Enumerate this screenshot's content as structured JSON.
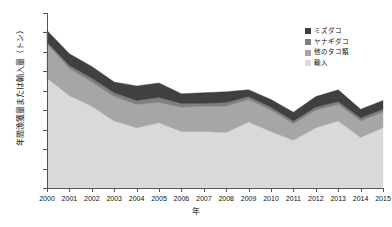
{
  "chart_data": {
    "type": "area",
    "stacked": true,
    "title": "",
    "xlabel": "年",
    "ylabel": "年間漁獲量または輸入量（トン）",
    "categories": [
      2000,
      2001,
      2002,
      2003,
      2004,
      2005,
      2006,
      2007,
      2008,
      2009,
      2010,
      2011,
      2012,
      2013,
      2014,
      2015
    ],
    "xtick_labels": [
      "2000",
      "2001",
      "2002",
      "2003",
      "2004",
      "2005",
      "2006",
      "2007",
      "2008",
      "2009",
      "2010",
      "2011",
      "2012",
      "2013",
      "2014",
      "2015"
    ],
    "ytick_labels": [
      "0",
      "20,000",
      "40,000",
      "60,000",
      "80,000",
      "100,000",
      "120,000",
      "140,000",
      "160,000",
      "180,000"
    ],
    "ytick_values": [
      0,
      20000,
      40000,
      60000,
      80000,
      100000,
      120000,
      140000,
      160000,
      180000
    ],
    "ylim": [
      0,
      180000
    ],
    "xlim": [
      2000,
      2015
    ],
    "grid": false,
    "legend_position": "top-right",
    "series": [
      {
        "name": "輸入",
        "color": "#d9d9d9",
        "values": [
          113000,
          95000,
          84000,
          69000,
          62000,
          67000,
          58000,
          58000,
          57000,
          68000,
          58000,
          49000,
          62000,
          69000,
          52000,
          62000
        ]
      },
      {
        "name": "他のタコ類",
        "color": "#a6a6a6",
        "values": [
          35000,
          28000,
          25000,
          25000,
          24000,
          21000,
          25000,
          26000,
          27000,
          23000,
          22000,
          17000,
          18000,
          17000,
          17000,
          16000
        ]
      },
      {
        "name": "ヤナギダコ",
        "color": "#808080",
        "values": [
          2000,
          3000,
          4000,
          4000,
          4000,
          5000,
          4000,
          3000,
          4000,
          3000,
          3000,
          3000,
          3000,
          3000,
          3000,
          3000
        ]
      },
      {
        "name": "ミズダコ",
        "color": "#404040",
        "values": [
          12000,
          12000,
          12000,
          11000,
          15000,
          15000,
          10000,
          11000,
          11000,
          7000,
          8000,
          9000,
          11000,
          12000,
          9000,
          9000
        ]
      }
    ],
    "totals": [
      162000,
      138000,
      125000,
      109000,
      105000,
      108000,
      97000,
      98000,
      99000,
      101000,
      91000,
      78000,
      94000,
      101000,
      81000,
      90000
    ]
  },
  "legend": {
    "items": [
      {
        "label": "ミズダコ",
        "color": "#404040"
      },
      {
        "label": "ヤナギダコ",
        "color": "#808080"
      },
      {
        "label": "他のタコ類",
        "color": "#a6a6a6"
      },
      {
        "label": "輸入",
        "color": "#d9d9d9"
      }
    ]
  }
}
